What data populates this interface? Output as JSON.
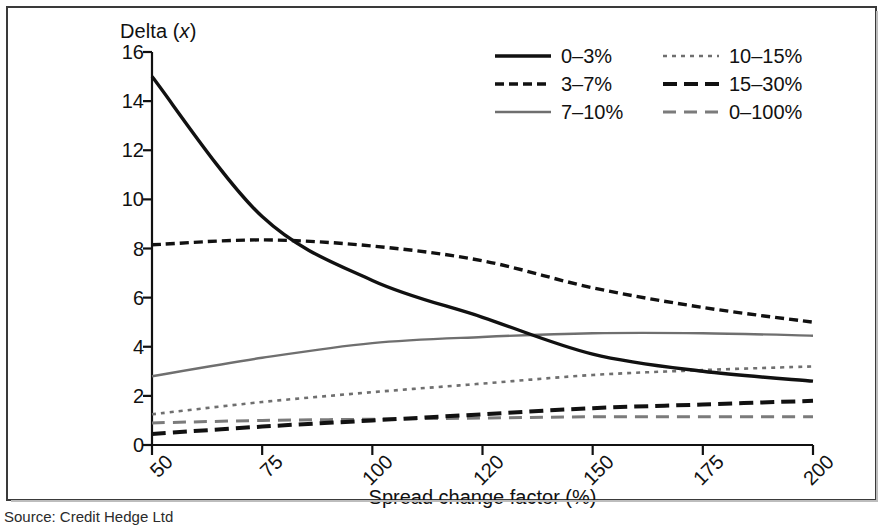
{
  "figure": {
    "y_axis_title_main": "Delta (",
    "y_axis_title_var": "x",
    "y_axis_title_tail": ")",
    "x_axis_title": "Spread change factor (%)",
    "source": "Source: Credit Hedge Ltd"
  },
  "chart_data": {
    "type": "line",
    "title": "",
    "xlabel": "Spread change factor (%)",
    "ylabel": "Delta (x)",
    "x": [
      50,
      75,
      100,
      120,
      150,
      175,
      200
    ],
    "xtick_labels": [
      "50",
      "75",
      "100",
      "120",
      "150",
      "175",
      "200"
    ],
    "ytick_labels": [
      "0",
      "2",
      "4",
      "6",
      "8",
      "10",
      "12",
      "14",
      "16"
    ],
    "ylim": [
      0,
      16
    ],
    "ytick_step": 2,
    "grid": false,
    "x_scale": "categorical-even",
    "legend_position": "top-right",
    "legend_columns": 2,
    "series": [
      {
        "name": "0–3%",
        "style": "solid",
        "color": "#111111",
        "width": 3.4,
        "dash": "",
        "values": [
          15.0,
          9.3,
          6.7,
          5.2,
          3.7,
          3.0,
          2.6
        ]
      },
      {
        "name": "3–7%",
        "style": "dashed-short",
        "color": "#111111",
        "width": 3.4,
        "dash": "9,5",
        "values": [
          8.15,
          8.35,
          8.1,
          7.5,
          6.4,
          5.6,
          5.0
        ]
      },
      {
        "name": "7–10%",
        "style": "solid",
        "color": "#6f6f6f",
        "width": 2.4,
        "dash": "",
        "values": [
          2.8,
          3.55,
          4.15,
          4.4,
          4.55,
          4.55,
          4.45
        ]
      },
      {
        "name": "10–15%",
        "style": "dotted-fine",
        "color": "#6f6f6f",
        "width": 2.6,
        "dash": "4,5",
        "values": [
          1.25,
          1.75,
          2.15,
          2.5,
          2.85,
          3.05,
          3.2
        ]
      },
      {
        "name": "15–30%",
        "style": "dashed-bold",
        "color": "#111111",
        "width": 4.0,
        "dash": "14,7",
        "values": [
          0.45,
          0.75,
          1.0,
          1.25,
          1.5,
          1.65,
          1.8
        ]
      },
      {
        "name": "0–100%",
        "style": "dashed-medium",
        "color": "#7b7b7b",
        "width": 3.0,
        "dash": "13,8",
        "values": [
          0.9,
          1.0,
          1.05,
          1.1,
          1.15,
          1.15,
          1.15
        ]
      }
    ]
  },
  "legend": {
    "entries": [
      {
        "label": "0–3%",
        "col": 0,
        "row": 0,
        "series": 0
      },
      {
        "label": "10–15%",
        "col": 1,
        "row": 0,
        "series": 3
      },
      {
        "label": "3–7%",
        "col": 0,
        "row": 1,
        "series": 1
      },
      {
        "label": "15–30%",
        "col": 1,
        "row": 1,
        "series": 4
      },
      {
        "label": "7–10%",
        "col": 0,
        "row": 2,
        "series": 2
      },
      {
        "label": "0–100%",
        "col": 1,
        "row": 2,
        "series": 5
      }
    ]
  }
}
